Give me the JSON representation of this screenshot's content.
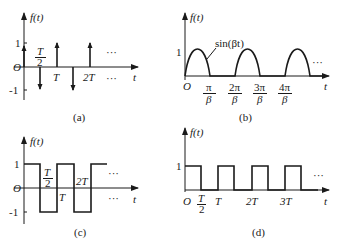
{
  "figure": {
    "panels": [
      {
        "id": "a",
        "caption": "(a)",
        "ylabel": "f(t)",
        "xlabel": "t",
        "origin": "O",
        "yticks": [
          "1",
          "-1"
        ],
        "xticks": [
          "T/2",
          "T",
          "2T"
        ],
        "xtick_num": "T",
        "xtick_den": "2",
        "xtick_T": "T",
        "xtick_2T": "2T",
        "ellipsis_top": "···",
        "ellipsis_bottom": "···",
        "description": "Alternating impulse train: +1 at 0, -1 at T/2, +1 at T, -1 at 3T/2, +1 at 2T, ..."
      },
      {
        "id": "b",
        "caption": "(b)",
        "ylabel": "f(t)",
        "xlabel": "t",
        "origin": "O",
        "ytick": "1",
        "curve_label": "sin(βt)",
        "xticks": [
          {
            "num": "π",
            "den": "β"
          },
          {
            "num": "2π",
            "den": "β"
          },
          {
            "num": "3π",
            "den": "β"
          },
          {
            "num": "4π",
            "den": "β"
          }
        ],
        "ellipsis": "···",
        "description": "Half-wave rectified sine: sin(βt) on [0,π/β], zero on [π/β,2π/β], repeating"
      },
      {
        "id": "c",
        "caption": "(c)",
        "ylabel": "f(t)",
        "xlabel": "t",
        "origin": "O",
        "yticks": [
          "1",
          "-1"
        ],
        "xtick_num": "T",
        "xtick_den": "2",
        "xtick_T": "T",
        "xtick_2T": "2T",
        "ellipsis_top": "···",
        "ellipsis_bottom": "···",
        "description": "Bipolar square wave between +1 and -1 with half-period T/2"
      },
      {
        "id": "d",
        "caption": "(d)",
        "ylabel": "f(t)",
        "xlabel": "t",
        "origin": "O",
        "ytick": "1",
        "xtick_num": "T",
        "xtick_den": "2",
        "xtick_T": "T",
        "xtick_2T": "2T",
        "xtick_3T": "3T",
        "ellipsis": "···",
        "description": "Unipolar rectangular pulse train, 0 to 1, width T/2, period T"
      }
    ]
  }
}
